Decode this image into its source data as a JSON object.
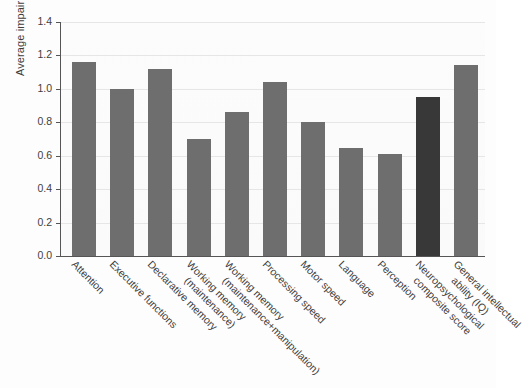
{
  "chart_data": {
    "type": "bar",
    "title": "",
    "xlabel": "",
    "ylabel": "Average impairment",
    "ylim": [
      0.0,
      1.4
    ],
    "ytick_labels": [
      "1.4",
      "1.2",
      "1.0",
      "0.8",
      "0.6",
      "0.4",
      "0.2",
      "0.0"
    ],
    "yticks": [
      1.4,
      1.2,
      1.0,
      0.8,
      0.6,
      0.4,
      0.2,
      0.0
    ],
    "grid": "horizontal",
    "legend": "none",
    "categories": [
      "Attention",
      "Executive functions",
      "Declarative memory",
      "Working memory (maintenance)",
      "Working memory (maintenance+manipulation)",
      "Processing speed",
      "Motor speed",
      "Language",
      "Perception",
      "Neuropsychological composite score",
      "General intellectual ability (IQ)"
    ],
    "category_lines": [
      [
        "Attention",
        ""
      ],
      [
        "Executive functions",
        ""
      ],
      [
        "Declarative memory",
        ""
      ],
      [
        "Working memory",
        "(maintenance)"
      ],
      [
        "Working memory",
        "(maintenance+manipulation)"
      ],
      [
        "Processing speed",
        ""
      ],
      [
        "Motor speed",
        ""
      ],
      [
        "Language",
        ""
      ],
      [
        "Perception",
        ""
      ],
      [
        "Neuropsychological",
        "composite score"
      ],
      [
        "General intellectual",
        "ability (IQ)"
      ]
    ],
    "values": [
      1.16,
      1.0,
      1.12,
      0.7,
      0.86,
      1.04,
      0.8,
      0.645,
      0.61,
      0.95,
      1.14
    ],
    "bar_colors": [
      "#6e6e6e",
      "#6e6e6e",
      "#6e6e6e",
      "#6e6e6e",
      "#6e6e6e",
      "#6e6e6e",
      "#6e6e6e",
      "#6e6e6e",
      "#6e6e6e",
      "#383838",
      "#6e6e6e"
    ],
    "highlight_index": 9,
    "colors": {
      "bar_default": "#6e6e6e",
      "bar_highlight": "#383838",
      "gridline": "#e6e6e6",
      "axis": "#555555",
      "text": "#3d3d3d",
      "background": "#fdfdfd"
    }
  }
}
